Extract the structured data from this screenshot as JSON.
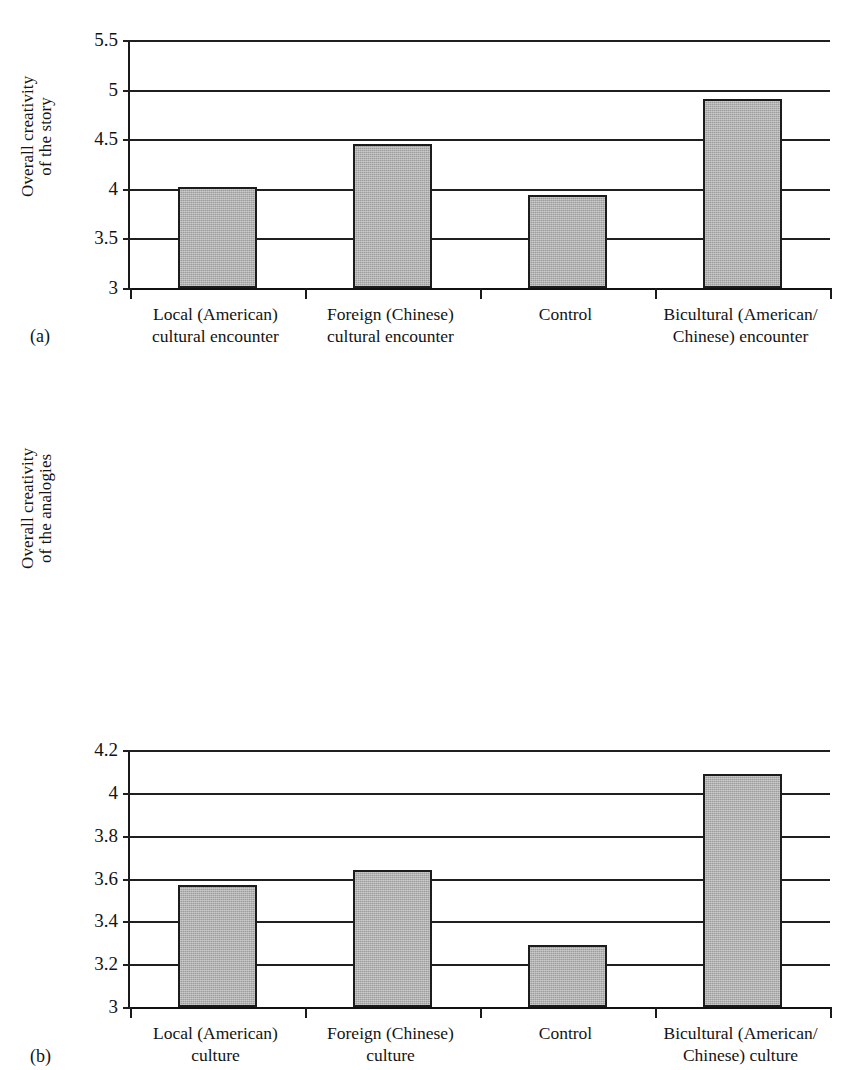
{
  "figure": {
    "panels": [
      {
        "letter": "(a)",
        "ylabel": "Overall creativity\nof the story"
      },
      {
        "letter": "(b)",
        "ylabel": "Overall creativity\nof the analogies"
      }
    ]
  },
  "chart_data": [
    {
      "type": "bar",
      "panel": "(a)",
      "title": "",
      "xlabel": "",
      "ylabel": "Overall creativity of the story",
      "categories": [
        "Local (American)\ncultural encounter",
        "Foreign (Chinese)\ncultural encounter",
        "Control",
        "Bicultural (American/\nChinese) encounter"
      ],
      "values": [
        4.02,
        4.45,
        3.94,
        4.91
      ],
      "ylim": [
        3,
        5.5
      ],
      "yticks": [
        3,
        3.5,
        4,
        4.5,
        5,
        5.5
      ],
      "ytick_labels": [
        "3",
        "3.5",
        "4",
        "4.5",
        "5",
        "5.5"
      ],
      "grid": true,
      "legend": "none",
      "bar_fill": "#9d9d9d",
      "bar_edge": "#1c1c1c"
    },
    {
      "type": "bar",
      "panel": "(b)",
      "title": "",
      "xlabel": "",
      "ylabel": "Overall creativity of the analogies",
      "categories": [
        "Local (American)\nculture",
        "Foreign (Chinese)\nculture",
        "Control",
        "Bicultural (American/\nChinese) culture"
      ],
      "values": [
        3.57,
        3.64,
        3.29,
        4.09
      ],
      "ylim": [
        3,
        4.2
      ],
      "yticks": [
        3,
        3.2,
        3.4,
        3.6,
        3.8,
        4,
        4.2
      ],
      "ytick_labels": [
        "3",
        "3.2",
        "3.4",
        "3.6",
        "3.8",
        "4",
        "4.2"
      ],
      "grid": true,
      "legend": "none",
      "bar_fill": "#9d9d9d",
      "bar_edge": "#1c1c1c"
    }
  ]
}
